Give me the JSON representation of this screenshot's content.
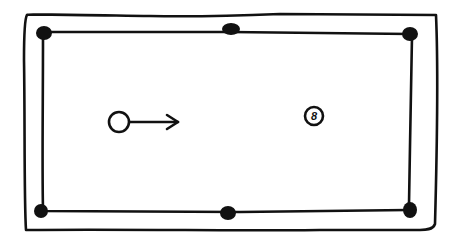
{
  "diagram": {
    "type": "pool-table",
    "colors": {
      "ink": "#111111",
      "background": "#ffffff"
    },
    "table": {
      "outer_rail": {
        "x": 24,
        "y": 13,
        "width": 413,
        "height": 218
      },
      "inner_cushion": {
        "x": 41,
        "y": 31,
        "width": 370,
        "height": 181
      }
    },
    "pockets": [
      {
        "name": "top-left",
        "x": 43,
        "y": 32
      },
      {
        "name": "top-middle",
        "x": 231,
        "y": 29
      },
      {
        "name": "top-right",
        "x": 411,
        "y": 33
      },
      {
        "name": "bottom-left",
        "x": 41,
        "y": 211
      },
      {
        "name": "bottom-middle",
        "x": 228,
        "y": 212
      },
      {
        "name": "bottom-right",
        "x": 410,
        "y": 210
      }
    ],
    "cue_ball": {
      "x": 119,
      "y": 122,
      "r": 10,
      "label": ""
    },
    "arrow": {
      "from_x": 130,
      "to_x": 178,
      "y": 122,
      "direction": "right"
    },
    "object_ball": {
      "x": 314,
      "y": 116,
      "r": 9,
      "label": "8"
    }
  }
}
